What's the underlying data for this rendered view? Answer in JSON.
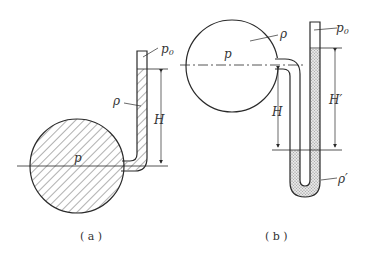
{
  "figure_a": {
    "caption": "( a )",
    "labels": {
      "p0": "p",
      "p0_sub": "0",
      "rho": "ρ",
      "H": "H",
      "p": "p"
    }
  },
  "figure_b": {
    "caption": "( b )",
    "labels": {
      "p0": "p",
      "p0_sub": "0",
      "rho": "ρ",
      "rho_prime": "ρ′",
      "H": "H",
      "H_prime": "H′",
      "p": "p"
    }
  },
  "colors": {
    "stroke": "#2a2a2a",
    "fill_hatch": "#3a3a3a",
    "fill_dots": "#9a9a9a"
  }
}
